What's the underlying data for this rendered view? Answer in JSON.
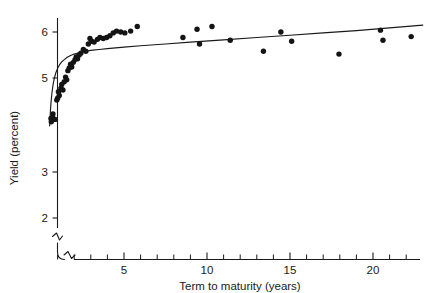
{
  "chart_data": {
    "type": "scatter",
    "title": "",
    "xlabel": "Term to maturity (years)",
    "ylabel": "Yield (percent)",
    "xlim": [
      0.4,
      23.2
    ],
    "ylim": [
      1.55,
      6.45
    ],
    "grid": false,
    "legend": null,
    "axis_break": {
      "axis": "y",
      "note": "y-axis is broken below 2 percent; x-axis origin also broken"
    },
    "xticks_major": [
      5,
      10,
      15,
      20
    ],
    "xticklabels": [
      "5",
      "10",
      "15",
      "20"
    ],
    "xticks_minor": [
      1,
      2,
      3,
      4,
      6,
      7,
      8,
      9,
      11,
      12,
      13,
      14,
      16,
      17,
      18,
      19,
      21,
      22
    ],
    "yticks_major": [
      2,
      3,
      5,
      6
    ],
    "yticklabels": [
      "2",
      "3",
      "5",
      "6"
    ],
    "series": [
      {
        "name": "Observed bond yields",
        "marker": "filled-circle",
        "color": "#141414",
        "points": [
          [
            0.6,
            4.12
          ],
          [
            0.62,
            4.05
          ],
          [
            0.7,
            4.14
          ],
          [
            0.72,
            4.22
          ],
          [
            0.85,
            4.1
          ],
          [
            0.95,
            4.52
          ],
          [
            1.0,
            4.56
          ],
          [
            1.05,
            4.7
          ],
          [
            1.1,
            4.62
          ],
          [
            1.2,
            4.78
          ],
          [
            1.25,
            4.86
          ],
          [
            1.32,
            4.74
          ],
          [
            1.4,
            4.92
          ],
          [
            1.48,
            5.02
          ],
          [
            1.55,
            4.96
          ],
          [
            1.62,
            5.16
          ],
          [
            1.7,
            5.22
          ],
          [
            1.78,
            5.3
          ],
          [
            1.85,
            5.24
          ],
          [
            1.95,
            5.34
          ],
          [
            2.05,
            5.4
          ],
          [
            2.12,
            5.46
          ],
          [
            2.2,
            5.42
          ],
          [
            2.3,
            5.5
          ],
          [
            2.4,
            5.54
          ],
          [
            2.55,
            5.62
          ],
          [
            2.7,
            5.58
          ],
          [
            2.85,
            5.74
          ],
          [
            2.95,
            5.86
          ],
          [
            3.05,
            5.8
          ],
          [
            3.2,
            5.78
          ],
          [
            3.4,
            5.84
          ],
          [
            3.55,
            5.88
          ],
          [
            3.75,
            5.86
          ],
          [
            3.95,
            5.88
          ],
          [
            4.15,
            5.92
          ],
          [
            4.35,
            5.98
          ],
          [
            4.55,
            6.02
          ],
          [
            4.8,
            6.0
          ],
          [
            5.05,
            5.98
          ],
          [
            5.4,
            6.02
          ],
          [
            5.8,
            6.12
          ],
          [
            8.55,
            5.88
          ],
          [
            9.4,
            6.06
          ],
          [
            9.55,
            5.74
          ],
          [
            10.3,
            6.12
          ],
          [
            11.4,
            5.82
          ],
          [
            13.4,
            5.58
          ],
          [
            14.45,
            6.0
          ],
          [
            15.1,
            5.8
          ],
          [
            17.95,
            5.52
          ],
          [
            20.45,
            6.04
          ],
          [
            20.6,
            5.82
          ],
          [
            22.3,
            5.9
          ]
        ]
      }
    ],
    "fit_curve": {
      "name": "Fitted yield curve",
      "color": "#1a1a1a",
      "points": [
        [
          0.52,
          3.96
        ],
        [
          0.56,
          4.24
        ],
        [
          0.6,
          4.46
        ],
        [
          0.66,
          4.68
        ],
        [
          0.72,
          4.84
        ],
        [
          0.8,
          4.99
        ],
        [
          0.9,
          5.12
        ],
        [
          1.0,
          5.21
        ],
        [
          1.12,
          5.29
        ],
        [
          1.25,
          5.35
        ],
        [
          1.4,
          5.4
        ],
        [
          1.58,
          5.45
        ],
        [
          1.78,
          5.49
        ],
        [
          2.0,
          5.52
        ],
        [
          2.3,
          5.55
        ],
        [
          2.65,
          5.58
        ],
        [
          3.0,
          5.6
        ],
        [
          3.5,
          5.62
        ],
        [
          4.0,
          5.64
        ],
        [
          5.0,
          5.67
        ],
        [
          6.0,
          5.7
        ],
        [
          7.5,
          5.74
        ],
        [
          9.0,
          5.78
        ],
        [
          11.0,
          5.83
        ],
        [
          13.0,
          5.88
        ],
        [
          15.0,
          5.93
        ],
        [
          17.0,
          5.98
        ],
        [
          19.0,
          6.03
        ],
        [
          21.0,
          6.09
        ],
        [
          23.0,
          6.15
        ]
      ]
    }
  },
  "labels": {
    "x_axis_title": "Term to maturity (years)",
    "y_axis_title": "Yield (percent)",
    "y_tick_6": "6",
    "y_tick_5": "5",
    "y_tick_3": "3",
    "y_tick_2": "2",
    "x_tick_5": "5",
    "x_tick_10": "10",
    "x_tick_15": "15",
    "x_tick_20": "20"
  }
}
